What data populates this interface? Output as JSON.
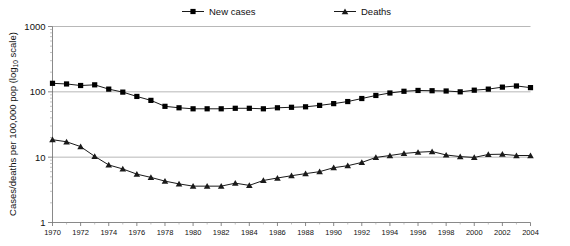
{
  "chart_data": {
    "type": "line",
    "title": "",
    "subtitle": "",
    "xlabel": "",
    "ylabel": "Cases/deaths per 100,000 pop (log10 scale)",
    "ylabel_main": "Cases/deaths per 100,000 pop (log",
    "ylabel_sub": "10",
    "ylabel_tail": " scale)",
    "yscale": "log10",
    "ylim": [
      1,
      1000
    ],
    "xlim": [
      1970,
      2004
    ],
    "grid": true,
    "grid_axis": "y",
    "legend_position": "top",
    "y_ticks": [
      1,
      10,
      100,
      1000
    ],
    "y_tick_labels": [
      "1",
      "10",
      "100",
      "1000"
    ],
    "x_ticks": [
      1970,
      1972,
      1974,
      1976,
      1978,
      1980,
      1982,
      1984,
      1986,
      1988,
      1990,
      1992,
      1994,
      1996,
      1998,
      2000,
      2002,
      2004
    ],
    "x_tick_labels": [
      "1970",
      "1972",
      "1974",
      "1976",
      "1978",
      "1980",
      "1982",
      "1984",
      "1986",
      "1988",
      "1990",
      "1992",
      "1994",
      "1996",
      "1998",
      "2000",
      "2002",
      "2004"
    ],
    "x_minor_ticks": [
      1971,
      1973,
      1975,
      1977,
      1979,
      1981,
      1983,
      1985,
      1987,
      1989,
      1991,
      1993,
      1995,
      1997,
      1999,
      2001,
      2003
    ],
    "x": [
      1970,
      1971,
      1972,
      1973,
      1974,
      1975,
      1976,
      1977,
      1978,
      1979,
      1980,
      1981,
      1982,
      1983,
      1984,
      1985,
      1986,
      1987,
      1988,
      1989,
      1990,
      1991,
      1992,
      1993,
      1994,
      1995,
      1996,
      1997,
      1998,
      1999,
      2000,
      2001,
      2002,
      2003,
      2004
    ],
    "series": [
      {
        "name": "New cases",
        "marker": "square",
        "color": "#000000",
        "values": [
          135,
          132,
          125,
          128,
          110,
          99,
          85,
          74,
          60,
          57,
          55,
          55,
          55,
          56,
          56,
          55,
          57,
          58,
          59,
          62,
          66,
          71,
          79,
          88,
          96,
          102,
          105,
          104,
          103,
          100,
          106,
          110,
          118,
          123,
          116
        ]
      },
      {
        "name": "Deaths",
        "marker": "triangle",
        "color": "#1a1a1a",
        "values": [
          18.5,
          17.2,
          14.5,
          10.3,
          7.6,
          6.6,
          5.5,
          4.9,
          4.3,
          3.9,
          3.6,
          3.6,
          3.6,
          4.0,
          3.7,
          4.4,
          4.8,
          5.2,
          5.6,
          6.0,
          6.9,
          7.4,
          8.3,
          9.9,
          10.6,
          11.4,
          11.9,
          12.2,
          10.8,
          10.2,
          9.9,
          11.0,
          11.1,
          10.6,
          10.6
        ]
      }
    ]
  },
  "legend": {
    "items": [
      {
        "label": "New cases",
        "marker": "square"
      },
      {
        "label": "Deaths",
        "marker": "triangle"
      }
    ]
  }
}
